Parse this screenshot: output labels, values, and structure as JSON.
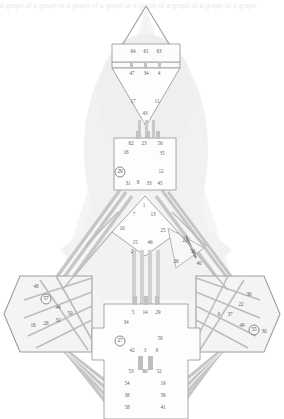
{
  "header": {
    "overflow_text": "a graph of a graph of a graph of a graph of a graph of a graph of a graph of a graph"
  },
  "palette": {
    "background": "#ffffff",
    "region_fill": "#e3e3e3",
    "region_fill_light": "#eeeeee",
    "edge_stroke": "#b9b9b9",
    "edge_stroke_dark": "#9a9a9a",
    "node_text": "#5d5d5d",
    "ring_stroke": "#8a8a8a",
    "header_text": "#e9e9e9"
  },
  "diagram": {
    "type": "node-link-graph",
    "width": 284,
    "height": 419,
    "node_count": 64,
    "highlighted_nodes": [
      29,
      57,
      27,
      55
    ]
  },
  "chart_data": {
    "type": "scatter",
    "title": "",
    "xlabel": "",
    "ylabel": "",
    "nodes": [
      {
        "id": 64,
        "x": 133,
        "y": 52,
        "ring": false
      },
      {
        "id": 61,
        "x": 146,
        "y": 52,
        "ring": false
      },
      {
        "id": 63,
        "x": 159,
        "y": 52,
        "ring": false
      },
      {
        "id": 47,
        "x": 132,
        "y": 74,
        "ring": false
      },
      {
        "id": 34,
        "x": 146,
        "y": 74,
        "ring": false
      },
      {
        "id": 4,
        "x": 159,
        "y": 74,
        "ring": false
      },
      {
        "id": 17,
        "x": 133,
        "y": 102,
        "ring": false
      },
      {
        "id": 11,
        "x": 157,
        "y": 102,
        "ring": false
      },
      {
        "id": 43,
        "x": 145,
        "y": 114,
        "ring": false
      },
      {
        "id": 62,
        "x": 131,
        "y": 144,
        "ring": false
      },
      {
        "id": 23,
        "x": 144,
        "y": 144,
        "ring": false
      },
      {
        "id": 56,
        "x": 160,
        "y": 144,
        "ring": false
      },
      {
        "id": 16,
        "x": 126,
        "y": 153,
        "ring": false
      },
      {
        "id": 35,
        "x": 162,
        "y": 154,
        "ring": false
      },
      {
        "id": 29,
        "x": 120,
        "y": 172,
        "ring": true
      },
      {
        "id": 12,
        "x": 161,
        "y": 172,
        "ring": false
      },
      {
        "id": 31,
        "x": 128,
        "y": 184,
        "ring": false
      },
      {
        "id": 8,
        "x": 138,
        "y": 183,
        "ring": false
      },
      {
        "id": 33,
        "x": 149,
        "y": 184,
        "ring": false
      },
      {
        "id": 45,
        "x": 160,
        "y": 184,
        "ring": false
      },
      {
        "id": 1,
        "x": 144,
        "y": 206,
        "ring": false
      },
      {
        "id": 7,
        "x": 134,
        "y": 215,
        "ring": false
      },
      {
        "id": 13,
        "x": 153,
        "y": 215,
        "ring": false
      },
      {
        "id": 10,
        "x": 122,
        "y": 229,
        "ring": false
      },
      {
        "id": 25,
        "x": 163,
        "y": 231,
        "ring": false
      },
      {
        "id": 15,
        "x": 135,
        "y": 243,
        "ring": false
      },
      {
        "id": 46,
        "x": 150,
        "y": 243,
        "ring": false
      },
      {
        "id": 21,
        "x": 185,
        "y": 241,
        "ring": false
      },
      {
        "id": 2,
        "x": 132,
        "y": 252,
        "ring": false
      },
      {
        "id": 51,
        "x": 193,
        "y": 252,
        "ring": false
      },
      {
        "id": 26,
        "x": 176,
        "y": 262,
        "ring": false
      },
      {
        "id": 40,
        "x": 199,
        "y": 264,
        "ring": false
      },
      {
        "id": 48,
        "x": 36,
        "y": 287,
        "ring": false
      },
      {
        "id": 57,
        "x": 46,
        "y": 299,
        "ring": true
      },
      {
        "id": 44,
        "x": 58,
        "y": 308,
        "ring": false
      },
      {
        "id": 50,
        "x": 70,
        "y": 314,
        "ring": false
      },
      {
        "id": 18,
        "x": 33,
        "y": 326,
        "ring": false
      },
      {
        "id": 28,
        "x": 46,
        "y": 324,
        "ring": false
      },
      {
        "id": 32,
        "x": 58,
        "y": 321,
        "ring": false
      },
      {
        "id": 36,
        "x": 249,
        "y": 295,
        "ring": false
      },
      {
        "id": 22,
        "x": 241,
        "y": 305,
        "ring": false
      },
      {
        "id": 6,
        "x": 219,
        "y": 315,
        "ring": false
      },
      {
        "id": 37,
        "x": 230,
        "y": 315,
        "ring": false
      },
      {
        "id": 49,
        "x": 242,
        "y": 326,
        "ring": false
      },
      {
        "id": 55,
        "x": 254,
        "y": 330,
        "ring": true
      },
      {
        "id": 30,
        "x": 264,
        "y": 332,
        "ring": false
      },
      {
        "id": 5,
        "x": 133,
        "y": 313,
        "ring": false
      },
      {
        "id": 14,
        "x": 145,
        "y": 313,
        "ring": false
      },
      {
        "id": 29.1,
        "label": "29",
        "x": 158,
        "y": 313,
        "ring": false
      },
      {
        "id": 34.1,
        "label": "34",
        "x": 126,
        "y": 323,
        "ring": false
      },
      {
        "id": 27,
        "x": 120,
        "y": 341,
        "ring": true
      },
      {
        "id": 59,
        "x": 160,
        "y": 339,
        "ring": false
      },
      {
        "id": 42,
        "x": 132,
        "y": 351,
        "ring": false
      },
      {
        "id": 3,
        "x": 145,
        "y": 351,
        "ring": false
      },
      {
        "id": 9,
        "x": 157,
        "y": 351,
        "ring": false
      },
      {
        "id": 53,
        "x": 131,
        "y": 372,
        "ring": false
      },
      {
        "id": 60,
        "x": 145,
        "y": 372,
        "ring": false
      },
      {
        "id": 52,
        "x": 159,
        "y": 372,
        "ring": false
      },
      {
        "id": 54,
        "x": 127,
        "y": 384,
        "ring": false
      },
      {
        "id": 19,
        "x": 163,
        "y": 384,
        "ring": false
      },
      {
        "id": 38,
        "x": 127,
        "y": 396,
        "ring": false
      },
      {
        "id": 39,
        "x": 163,
        "y": 396,
        "ring": false
      },
      {
        "id": 58,
        "x": 127,
        "y": 408,
        "ring": false
      },
      {
        "id": 41,
        "x": 163,
        "y": 408,
        "ring": false
      }
    ]
  }
}
